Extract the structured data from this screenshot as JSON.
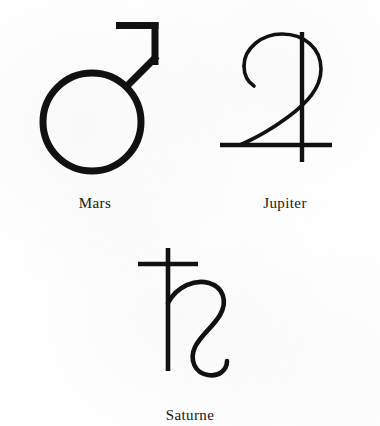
{
  "page": {
    "background_color": "#ffffff",
    "ink_color": "#111111"
  },
  "symbols": [
    {
      "id": "mars",
      "icon_name": "mars-symbol-icon",
      "label": "Mars",
      "unicode": "♂",
      "description": "circle with arrow pointing upper right"
    },
    {
      "id": "jupiter",
      "icon_name": "jupiter-symbol-icon",
      "label": "Jupiter",
      "unicode": "♃",
      "description": "numeral four like curve crossed by a vertical stroke"
    },
    {
      "id": "saturne",
      "icon_name": "saturn-symbol-icon",
      "label": "Saturne",
      "unicode": "♄",
      "description": "cross above a descending hooked tail"
    }
  ]
}
